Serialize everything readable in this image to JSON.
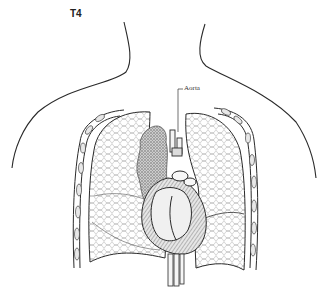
{
  "figure": {
    "title": "T4",
    "labels": [
      {
        "text": "Aorta",
        "target": "aorta"
      }
    ]
  },
  "colors": {
    "background": "#ffffff",
    "line": "#2a2a2a",
    "lung_texture": "#9a9a9a",
    "heart_shade": "#6a6a6a"
  }
}
